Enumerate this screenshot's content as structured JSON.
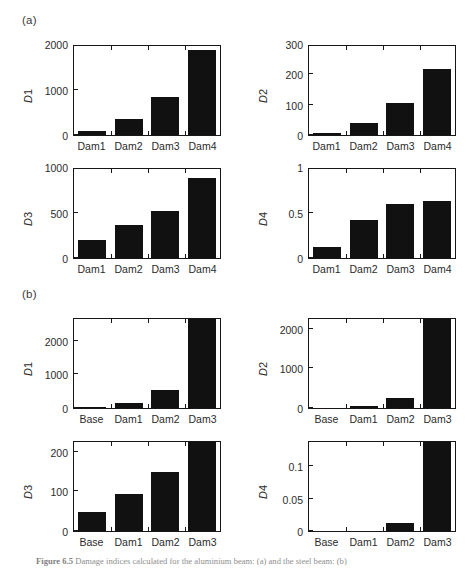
{
  "figure": {
    "panel_a_label": "(a)",
    "panel_b_label": "(b)",
    "caption_prefix": "Figure 6.5",
    "caption_text": "Damage indices calculated for the aluminium beam: (a) and the steel beam: (b)"
  },
  "chart_data": [
    {
      "id": "a-D1",
      "type": "bar",
      "panel": "(a)",
      "title": "",
      "xlabel": "",
      "ylabel": "D1",
      "categories": [
        "Dam1",
        "Dam2",
        "Dam3",
        "Dam4"
      ],
      "values": [
        100,
        350,
        860,
        1910
      ],
      "ylim": [
        0,
        2000
      ],
      "yticks": [
        0,
        1000,
        2000
      ],
      "ytick_labels": [
        "0",
        "1000",
        "2000"
      ],
      "grid": false,
      "bar_color": "#111111"
    },
    {
      "id": "a-D2",
      "type": "bar",
      "panel": "(a)",
      "title": "",
      "xlabel": "",
      "ylabel": "D2",
      "categories": [
        "Dam1",
        "Dam2",
        "Dam3",
        "Dam4"
      ],
      "values": [
        8,
        42,
        107,
        222
      ],
      "ylim": [
        0,
        300
      ],
      "yticks": [
        0,
        100,
        200,
        300
      ],
      "ytick_labels": [
        "0",
        "100",
        "200",
        "300"
      ],
      "grid": false,
      "bar_color": "#111111"
    },
    {
      "id": "a-D3",
      "type": "bar",
      "panel": "(a)",
      "title": "",
      "xlabel": "",
      "ylabel": "D3",
      "categories": [
        "Dam1",
        "Dam2",
        "Dam3",
        "Dam4"
      ],
      "values": [
        200,
        370,
        525,
        900
      ],
      "ylim": [
        0,
        1000
      ],
      "yticks": [
        0,
        500,
        1000
      ],
      "ytick_labels": [
        "0",
        "500",
        "1000"
      ],
      "grid": false,
      "bar_color": "#111111"
    },
    {
      "id": "a-D4",
      "type": "bar",
      "panel": "(a)",
      "title": "",
      "xlabel": "",
      "ylabel": "D4",
      "categories": [
        "Dam1",
        "Dam2",
        "Dam3",
        "Dam4"
      ],
      "values": [
        0.12,
        0.43,
        0.61,
        0.64
      ],
      "ylim": [
        0,
        1
      ],
      "yticks": [
        0,
        0.5,
        1
      ],
      "ytick_labels": [
        "0",
        "0.5",
        "1"
      ],
      "grid": false,
      "bar_color": "#111111"
    },
    {
      "id": "b-D1",
      "type": "bar",
      "panel": "(b)",
      "title": "",
      "xlabel": "",
      "ylabel": "D1",
      "categories": [
        "Base",
        "Dam1",
        "Dam2",
        "Dam3"
      ],
      "values": [
        30,
        150,
        560,
        2700
      ],
      "ylim": [
        0,
        2700
      ],
      "yticks": [
        0,
        1000,
        2000
      ],
      "ytick_labels": [
        "0",
        "1000",
        "2000"
      ],
      "grid": false,
      "bar_color": "#111111"
    },
    {
      "id": "b-D2",
      "type": "bar",
      "panel": "(b)",
      "title": "",
      "xlabel": "",
      "ylabel": "D2",
      "categories": [
        "Base",
        "Dam1",
        "Dam2",
        "Dam3"
      ],
      "values": [
        5,
        50,
        250,
        2300
      ],
      "ylim": [
        0,
        2300
      ],
      "yticks": [
        0,
        1000,
        2000
      ],
      "ytick_labels": [
        "0",
        "1000",
        "2000"
      ],
      "grid": false,
      "bar_color": "#111111"
    },
    {
      "id": "b-D3",
      "type": "bar",
      "panel": "(b)",
      "title": "",
      "xlabel": "",
      "ylabel": "D3",
      "categories": [
        "Base",
        "Dam1",
        "Dam2",
        "Dam3"
      ],
      "values": [
        48,
        95,
        153,
        230
      ],
      "ylim": [
        0,
        230
      ],
      "yticks": [
        0,
        100,
        200
      ],
      "ytick_labels": [
        "0",
        "100",
        "200"
      ],
      "grid": false,
      "bar_color": "#111111"
    },
    {
      "id": "b-D4",
      "type": "bar",
      "panel": "(b)",
      "title": "",
      "xlabel": "",
      "ylabel": "D4",
      "categories": [
        "Base",
        "Dam1",
        "Dam2",
        "Dam3"
      ],
      "values": [
        0.0,
        0.0,
        0.012,
        0.14
      ],
      "ylim": [
        0,
        0.14
      ],
      "yticks": [
        0,
        0.05,
        0.1
      ],
      "ytick_labels": [
        "0",
        "0.05",
        "0.1"
      ],
      "grid": false,
      "bar_color": "#111111"
    }
  ]
}
